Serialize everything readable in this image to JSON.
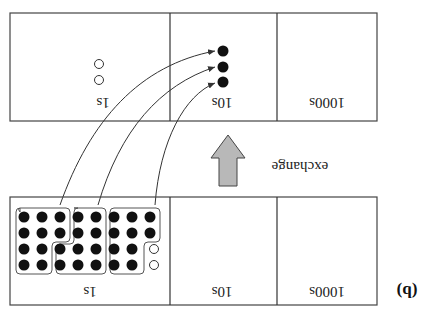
{
  "figure": {
    "orientation": "rotated-180",
    "panel_tag": "(b)",
    "exchange_label": "exchange",
    "colors": {
      "stroke": "#333333",
      "dot_fill": "#111111",
      "arrow_fill": "#b8b8b8",
      "background": "#ffffff"
    }
  },
  "before": {
    "columns": [
      {
        "label": "1000s",
        "filled": 0,
        "open": 0
      },
      {
        "label": "10s",
        "filled": 0,
        "open": 0
      },
      {
        "label": "1s",
        "filled": 30,
        "open": 2,
        "groups_of_ten": 3
      }
    ]
  },
  "after": {
    "columns": [
      {
        "label": "1000s",
        "filled": 0,
        "open": 0
      },
      {
        "label": "10s",
        "filled": 3,
        "open": 0
      },
      {
        "label": "1s",
        "filled": 0,
        "open": 2
      }
    ]
  }
}
